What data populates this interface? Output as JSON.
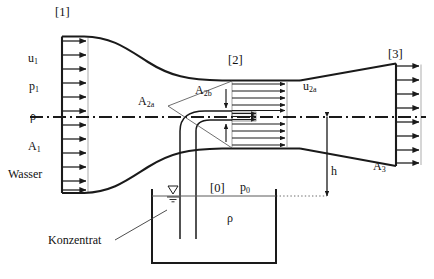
{
  "diagram": {
    "sections": {
      "inlet": "[1]",
      "throat": "[2]",
      "outlet": "[3]",
      "tank": "[0]"
    },
    "labels": {
      "u1_base": "u",
      "u1_sub": "1",
      "p1_base": "p",
      "p1_sub": "1",
      "rho_inlet": "ρ",
      "A1_base": "A",
      "A1_sub": "1",
      "water": "Wasser",
      "A2a_base": "A",
      "A2a_sub": "2a",
      "A2b_base": "A",
      "A2b_sub": "2b",
      "u2a_base": "u",
      "u2a_sub": "2a",
      "A3_base": "A",
      "A3_sub": "3",
      "h": "h",
      "p0_base": "p",
      "p0_sub": "0",
      "rho_tank": "ρ",
      "concentrate": "Konzentrat"
    },
    "colors": {
      "line": "#1a1a1a",
      "thin": "#3a3a3a",
      "background": "#ffffff"
    },
    "geometry": {
      "inlet_arrow_count": 11,
      "throat_long_arrow_count": 10,
      "throat_short_arrow_count": 5,
      "outlet_arrow_count": 8,
      "centerline_style": "dash-dot"
    }
  }
}
